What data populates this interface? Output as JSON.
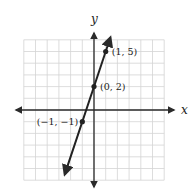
{
  "chart_data": {
    "type": "line",
    "title": "",
    "xlabel": "x",
    "ylabel": "y",
    "xlim": [
      -6,
      6
    ],
    "ylim": [
      -6,
      6
    ],
    "grid": true,
    "equation": "y = 3x + 2",
    "series": [
      {
        "name": "line",
        "x": [
          -2.5,
          1.4
        ],
        "y": [
          -5.5,
          6.2
        ]
      }
    ],
    "points": [
      {
        "x": 1,
        "y": 5,
        "label": "(1, 5)"
      },
      {
        "x": 0,
        "y": 2,
        "label": "(0, 2)"
      },
      {
        "x": -1,
        "y": -1,
        "label": "(−1, −1)"
      }
    ]
  }
}
